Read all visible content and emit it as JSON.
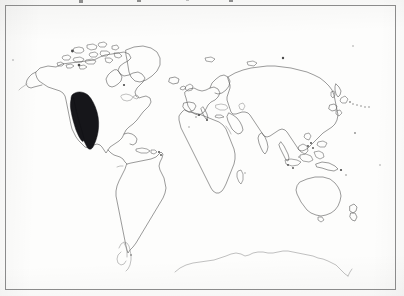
{
  "figure": {
    "kind": "distribution-map",
    "title": "",
    "caption_above_cropped": true,
    "frame": {
      "visible": true,
      "stroke_color": "#8b8b8b",
      "x": 5,
      "y": 5,
      "width": 391,
      "height": 285
    },
    "canvas": {
      "width": 404,
      "height": 296,
      "background_color": "#fdfdfc"
    }
  },
  "map": {
    "projection_note": "equirectangular world map, outline only",
    "line_color": "#5d5d5d",
    "ocean_color": "#fdfdfc",
    "land_fill": "none",
    "labels": [],
    "graticule": false,
    "scale_bar": false,
    "legend": {
      "visible": false,
      "entries": []
    },
    "regions": [
      {
        "name": "north-america",
        "shaded": false
      },
      {
        "name": "south-america",
        "shaded": false
      },
      {
        "name": "greenland",
        "shaded": false
      },
      {
        "name": "eurasia",
        "shaded": false
      },
      {
        "name": "africa",
        "shaded": false
      },
      {
        "name": "australia",
        "shaded": false
      },
      {
        "name": "antarctica",
        "shaded": false
      }
    ],
    "distribution": {
      "name": "western-north-america-range",
      "shaded": true,
      "fill_color": "#16161a",
      "description": "solid black band along western North America from the Pacific Northwest south through Mexico"
    }
  },
  "chart_data": {
    "type": "map",
    "title": "",
    "subtitle": "",
    "xlabel": "",
    "ylabel": "",
    "series": [
      {
        "name": "distribution-range",
        "color": "#16161a",
        "areas": [
          "western North America",
          "Pacific coast United States",
          "Mexico"
        ]
      }
    ],
    "legend_position": "none",
    "grid": false
  }
}
